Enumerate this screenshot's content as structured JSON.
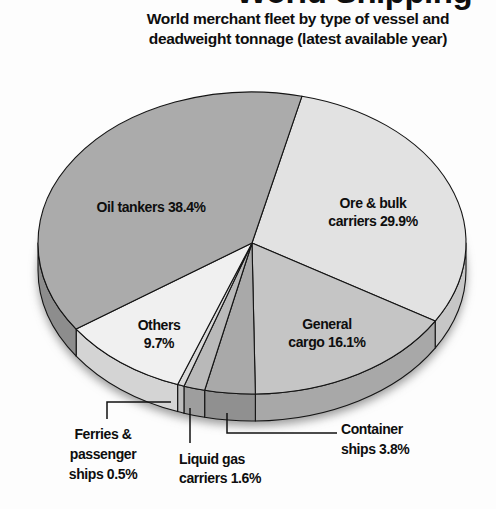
{
  "chart_data": {
    "type": "pie",
    "title": "World Shipping",
    "subtitle_lines": [
      "World merchant fleet by type of vessel and",
      "deadweight tonnage (latest available year)"
    ],
    "slices": [
      {
        "label": "Ore & bulk carriers",
        "value": 29.9,
        "label_lines": [
          "Ore & bulk",
          "carriers 29.9%"
        ],
        "color": "#e2e2e2",
        "side_color": "#c6c6c6"
      },
      {
        "label": "General cargo",
        "value": 16.1,
        "label_lines": [
          "General",
          "cargo 16.1%"
        ],
        "color": "#c5c5c5",
        "side_color": "#a8a8a8"
      },
      {
        "label": "Container ships",
        "value": 3.8,
        "label_lines": [
          "Container",
          "ships 3.8%"
        ],
        "color": "#a9a9a9",
        "side_color": "#909090"
      },
      {
        "label": "Liquid gas carriers",
        "value": 1.6,
        "label_lines": [
          "Liquid gas",
          "carriers 1.6%"
        ],
        "color": "#b9b9b9",
        "side_color": "#9e9e9e"
      },
      {
        "label": "Ferries & passenger ships",
        "value": 0.5,
        "label_lines": [
          "Ferries &",
          "passenger",
          "ships 0.5%"
        ],
        "color": "#d9d9d9",
        "side_color": "#bdbdbd"
      },
      {
        "label": "Others",
        "value": 9.7,
        "label_lines": [
          "Others",
          "9.7%"
        ],
        "color": "#f0f0f0",
        "side_color": "#d4d4d4"
      },
      {
        "label": "Oil tankers",
        "value": 38.4,
        "label_lines": [
          "Oil tankers 38.4%"
        ],
        "color": "#ababab",
        "side_color": "#8d8d8d"
      }
    ],
    "layout": {
      "style": "3d-pie",
      "legend": "labels-on-and-around-pie",
      "cx": 252,
      "cy": 243,
      "rx": 214,
      "ry": 151,
      "depth": 27,
      "start_angle_deg": -76.5,
      "outline_color": "#141414",
      "callouts": [
        {
          "name": "ferries-passenger-ships",
          "points": [
            [
              107,
              419
            ],
            [
              107,
              402
            ],
            [
              171,
              402
            ]
          ]
        },
        {
          "name": "liquid-gas-carriers",
          "points": [
            [
              190,
              408
            ],
            [
              190,
              443
            ]
          ]
        },
        {
          "name": "container-ships",
          "points": [
            [
              227,
              413
            ],
            [
              227,
              433
            ],
            [
              337,
              433
            ]
          ]
        }
      ]
    }
  }
}
